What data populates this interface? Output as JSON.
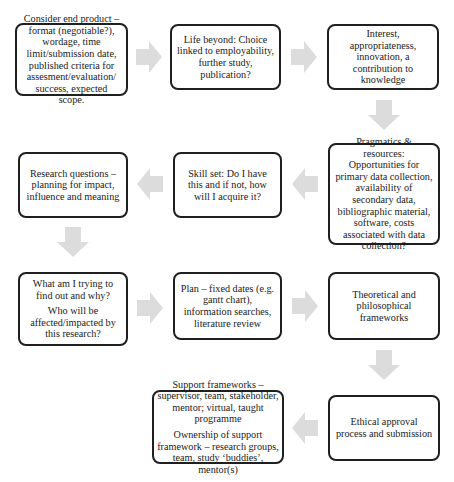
{
  "diagram": {
    "type": "flowchart",
    "arrow_color": "#dcdcdc",
    "border_color": "#1f1f1f",
    "steps": [
      {
        "id": "end-product",
        "paragraphs": [
          "Consider end product – format (negotiable?), wordage, time limit/submission date, published criteria for assesment/evaluation/ success, expected scope."
        ]
      },
      {
        "id": "life-beyond",
        "paragraphs": [
          "Life beyond: Choice linked to employability, further study, publication?"
        ]
      },
      {
        "id": "interest",
        "paragraphs": [
          "Interest, appropriateness, innovation, a contribution to knowledge"
        ]
      },
      {
        "id": "pragmatics",
        "paragraphs": [
          "Pragmatics & resources: Opportunities for primary data collection, availability of secondary data, bibliographic material, software, costs associated with data collection?"
        ]
      },
      {
        "id": "skill-set",
        "paragraphs": [
          "Skill set: Do I have this and if not, how will I acquire it?"
        ]
      },
      {
        "id": "research-questions",
        "paragraphs": [
          "Research questions – planning for impact, influence and meaning"
        ]
      },
      {
        "id": "what-why",
        "paragraphs": [
          "What am I trying to find out and why?",
          "Who will be affected/impacted by this research?"
        ]
      },
      {
        "id": "plan",
        "paragraphs": [
          "Plan – fixed dates (e.g. gantt chart), information searches, literature review"
        ]
      },
      {
        "id": "frameworks",
        "paragraphs": [
          "Theoretical and philosophical frameworks"
        ]
      },
      {
        "id": "ethical",
        "paragraphs": [
          "Ethical approval process and submission"
        ]
      },
      {
        "id": "support",
        "paragraphs": [
          "Support frameworks – supervisor, team, stakeholder, mentor; virtual, taught programme",
          "Ownership of support framework – research groups, team, study ‘buddies’, mentor(s)"
        ]
      }
    ],
    "connections": [
      {
        "from": "end-product",
        "to": "life-beyond",
        "direction": "right"
      },
      {
        "from": "life-beyond",
        "to": "interest",
        "direction": "right"
      },
      {
        "from": "interest",
        "to": "pragmatics",
        "direction": "down"
      },
      {
        "from": "pragmatics",
        "to": "skill-set",
        "direction": "left"
      },
      {
        "from": "skill-set",
        "to": "research-questions",
        "direction": "left"
      },
      {
        "from": "research-questions",
        "to": "what-why",
        "direction": "down"
      },
      {
        "from": "what-why",
        "to": "plan",
        "direction": "right"
      },
      {
        "from": "plan",
        "to": "frameworks",
        "direction": "right"
      },
      {
        "from": "frameworks",
        "to": "ethical",
        "direction": "down"
      },
      {
        "from": "ethical",
        "to": "support",
        "direction": "left"
      }
    ]
  }
}
